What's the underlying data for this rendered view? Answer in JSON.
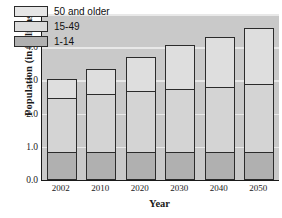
{
  "chart_data": {
    "type": "bar",
    "title": "",
    "xlabel": "Year",
    "ylabel": "Population (in billions)",
    "categories": [
      "2002",
      "2010",
      "2020",
      "2030",
      "2040",
      "2050"
    ],
    "ylim": [
      0.0,
      5.0
    ],
    "yticks": [
      "0.0",
      "1.0",
      "2.0",
      "3.0",
      "4.0",
      "5.0"
    ],
    "ytick_values": [
      0.0,
      1.0,
      2.0,
      3.0,
      4.0,
      5.0
    ],
    "grid": true,
    "stacked": true,
    "legend_position": "upper-left",
    "series": [
      {
        "name": "1-14",
        "values": [
          0.83,
          0.83,
          0.83,
          0.83,
          0.83,
          0.83
        ]
      },
      {
        "name": "15-49",
        "values": [
          1.67,
          1.79,
          1.89,
          1.94,
          1.99,
          2.1
        ]
      },
      {
        "name": "50 and older",
        "values": [
          0.6,
          0.8,
          1.06,
          1.35,
          1.56,
          1.72
        ]
      }
    ],
    "cumulative_tops": {
      "1-14": [
        0.83,
        0.83,
        0.83,
        0.83,
        0.83,
        0.83
      ],
      "15-49": [
        2.5,
        2.62,
        2.72,
        2.77,
        2.82,
        2.93
      ],
      "50 and older": [
        3.1,
        3.42,
        3.78,
        4.12,
        4.38,
        4.65
      ]
    },
    "colors": {
      "1-14": "#b0b0b0",
      "15-49": "#d4d4d4",
      "50 and older": "#dedede",
      "plot_background": "#c9c9c9",
      "gridline": "#ededed",
      "axis": "#1a1a1a",
      "bar_border": "#2b2b2b"
    }
  },
  "legend": {
    "items": [
      {
        "label": "50 and older"
      },
      {
        "label": "15-49"
      },
      {
        "label": "1-14"
      }
    ]
  }
}
